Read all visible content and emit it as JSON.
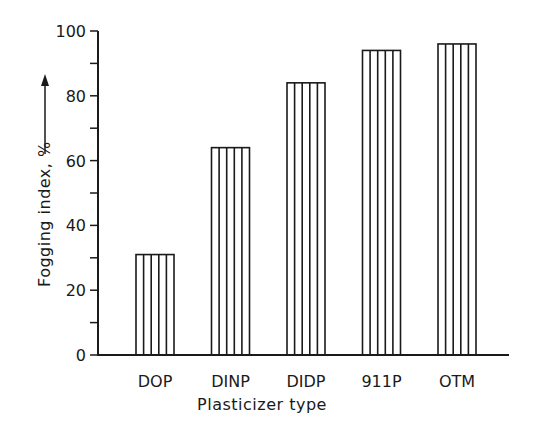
{
  "chart_data": {
    "type": "bar",
    "title": "",
    "xlabel": "Plasticizer type",
    "ylabel": "Fogging index, %",
    "ylabel_arrow": "up-arrow",
    "categories": [
      "DOP",
      "DINP",
      "DIDP",
      "911P",
      "OTM"
    ],
    "values": [
      31,
      64,
      84,
      94,
      96
    ],
    "ylim": [
      0,
      100
    ],
    "yticks": [
      0,
      20,
      40,
      60,
      80,
      100
    ],
    "yticks_minor": [
      10,
      30,
      50,
      70,
      90
    ],
    "grid": false,
    "legend": null,
    "bar_fill": "vertical-hatch",
    "colors": {
      "ink": "#1a1a1a",
      "background": "#ffffff"
    }
  }
}
